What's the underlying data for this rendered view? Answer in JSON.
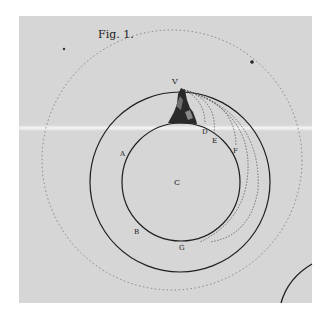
{
  "figure": {
    "title": "Fig. 1.",
    "labels": {
      "V": "V",
      "D": "D",
      "E": "E",
      "F": "F",
      "A": "A",
      "C": "C",
      "B": "B",
      "G": "G"
    },
    "colors": {
      "paper": "#d6d6d6",
      "ink": "#1e1e1e",
      "background": "#ffffff"
    }
  }
}
